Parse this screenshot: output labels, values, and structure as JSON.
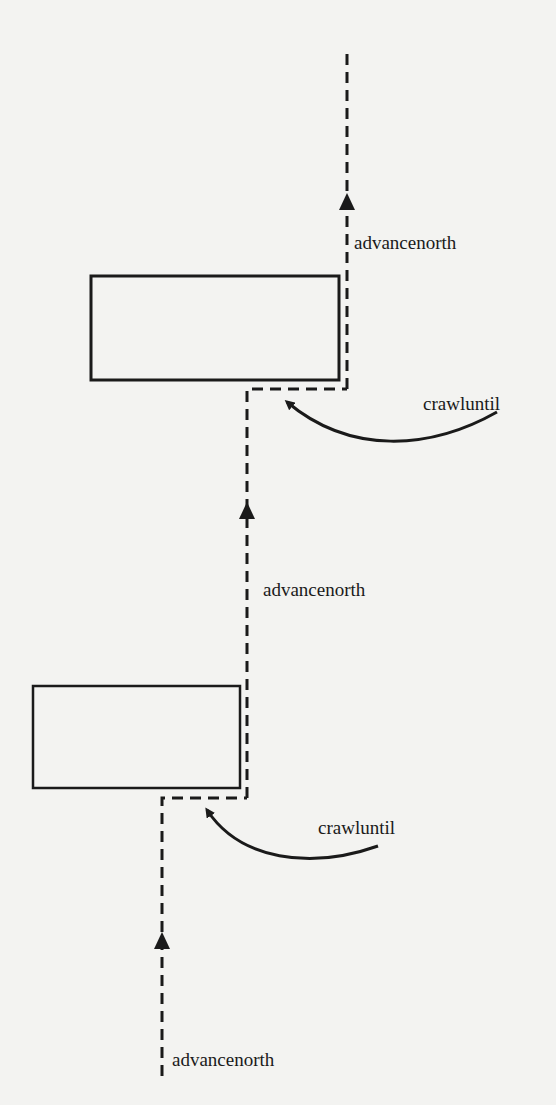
{
  "diagram": {
    "type": "robot-path",
    "colors": {
      "background": "#f3f3f1",
      "ink": "#1a1a1a"
    },
    "obstacles": [
      {
        "id": "upper-obstacle",
        "x": 91,
        "y": 275,
        "w": 248,
        "h": 105
      },
      {
        "id": "lower-obstacle",
        "x": 33,
        "y": 686,
        "w": 207,
        "h": 102
      }
    ],
    "labels": {
      "advance_top": "advancenorth",
      "crawl_top": "crawluntil",
      "advance_middle": "advancenorth",
      "crawl_bottom": "crawluntil",
      "advance_bottom": "advancenorth"
    }
  }
}
